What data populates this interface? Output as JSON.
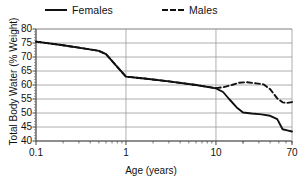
{
  "chart_data": {
    "type": "line",
    "title": "",
    "xlabel": "Age (years)",
    "ylabel": "Total Body Water (% Weight)",
    "xscale": "log",
    "xlim": [
      0.1,
      70
    ],
    "ylim": [
      40,
      80
    ],
    "xticks": [
      0.1,
      1,
      10,
      70
    ],
    "xticklabels": [
      "0.1",
      "1",
      "10",
      "70"
    ],
    "yticks": [
      40,
      45,
      50,
      55,
      60,
      65,
      70,
      75,
      80
    ],
    "yticklabels": [
      "40",
      "45",
      "50",
      "55",
      "60",
      "65",
      "70",
      "75",
      "80"
    ],
    "grid": "horizontal-and-major-vertical",
    "legend_position": "top",
    "series": [
      {
        "name": "Females",
        "style": "solid",
        "color": "#111111",
        "x": [
          0.1,
          0.2,
          0.35,
          0.5,
          0.6,
          0.8,
          1.0,
          1.6,
          3.0,
          6.0,
          10.0,
          12.0,
          14.0,
          17.0,
          20.0,
          25.0,
          32.0,
          40.0,
          48.0,
          55.0,
          62.0,
          70.0
        ],
        "y": [
          75.5,
          74.2,
          73.0,
          72.2,
          71.0,
          66.5,
          63.0,
          62.3,
          61.3,
          60.0,
          58.8,
          57.5,
          55.0,
          52.0,
          50.2,
          49.8,
          49.5,
          49.0,
          47.8,
          44.2,
          43.8,
          43.4
        ]
      },
      {
        "name": "Males",
        "style": "dashed",
        "color": "#111111",
        "x": [
          0.1,
          0.2,
          0.35,
          0.5,
          0.6,
          0.8,
          1.0,
          1.6,
          3.0,
          6.0,
          10.0,
          12.0,
          15.0,
          18.0,
          22.0,
          28.0,
          34.0,
          40.0,
          48.0,
          55.0,
          62.0,
          70.0
        ],
        "y": [
          75.5,
          74.2,
          73.0,
          72.2,
          71.0,
          66.5,
          63.0,
          62.3,
          61.3,
          60.0,
          58.9,
          59.2,
          60.0,
          60.8,
          61.0,
          60.6,
          60.2,
          58.5,
          55.2,
          53.8,
          53.6,
          53.9
        ]
      }
    ]
  },
  "legend": {
    "entries": [
      {
        "label": "Females",
        "style": "solid"
      },
      {
        "label": "Males",
        "style": "dashed"
      }
    ]
  },
  "axes": {
    "x_title": "Age (years)",
    "y_title": "Total Body Water (% Weight)"
  },
  "colors": {
    "line": "#111111",
    "grid": "#9a9a9a",
    "axis": "#555555",
    "background": "#ffffff"
  }
}
